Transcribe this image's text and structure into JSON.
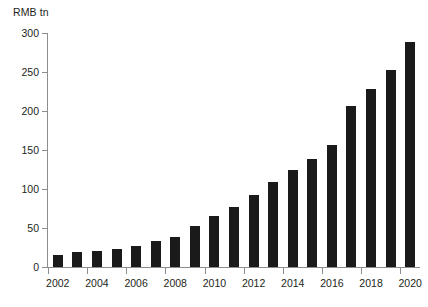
{
  "chart_data": {
    "type": "bar",
    "title": "",
    "subtitle": "",
    "xlabel": "",
    "ylabel": "RMB tn",
    "unit_label": "RMB tn",
    "categories": [
      "2002",
      "2003",
      "2004",
      "2005",
      "2006",
      "2007",
      "2008",
      "2009",
      "2010",
      "2011",
      "2012",
      "2013",
      "2014",
      "2015",
      "2016",
      "2017",
      "2018",
      "2019",
      "2020"
    ],
    "values": [
      15,
      19,
      21,
      23,
      27,
      33,
      39,
      52,
      66,
      77,
      92,
      109,
      124,
      139,
      157,
      207,
      228,
      253,
      289
    ],
    "series": [
      {
        "name": "RMB tn",
        "values": [
          15,
          19,
          21,
          23,
          27,
          33,
          39,
          52,
          66,
          77,
          92,
          109,
          124,
          139,
          157,
          207,
          228,
          253,
          289
        ]
      }
    ],
    "ylim": [
      0,
      300
    ],
    "y_ticks": [
      0,
      50,
      100,
      150,
      200,
      250,
      300
    ],
    "y_tick_labels": [
      "0",
      "50",
      "100",
      "150",
      "200",
      "250",
      "300"
    ],
    "x_tick_labels": [
      "2002",
      "2004",
      "2006",
      "2008",
      "2010",
      "2012",
      "2014",
      "2016",
      "2018",
      "2020"
    ],
    "grid": false,
    "legend": false,
    "legend_position": "none",
    "bar_color": "#1a1a1a",
    "axis_color": "#8d8d8d",
    "text_color": "#231f20",
    "background_color": "#ffffff"
  }
}
